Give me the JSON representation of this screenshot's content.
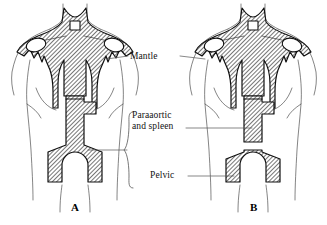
{
  "diagram": {
    "type": "anatomical-line-diagram",
    "ink_color": "#111111",
    "hatch_color": "#111111",
    "background": "#ffffff",
    "labels": {
      "mantle": "Mantle",
      "paraaortic_line1": "Paraaortic",
      "paraaortic_line2": "and spleen",
      "pelvic": "Pelvic"
    },
    "panels": [
      {
        "id": "A",
        "label": "A",
        "fields": [
          "Mantle",
          "Paraaortic and spleen",
          "Pelvic"
        ],
        "note": "Subdiaphragmatic fields joined as a continuous inverted-Y"
      },
      {
        "id": "B",
        "label": "B",
        "fields": [
          "Mantle",
          "Paraaortic and spleen",
          "Pelvic"
        ],
        "note": "Paraaortic/spleen and pelvic fields separated by a gap"
      }
    ],
    "leaders": [
      {
        "from": "mantle",
        "to": "panel-A-mantle"
      },
      {
        "from": "mantle",
        "to": "panel-B-mantle"
      },
      {
        "from": "paraaortic",
        "to": "panel-A-paraaortic-brace"
      },
      {
        "from": "paraaortic",
        "to": "panel-B-paraaortic"
      },
      {
        "from": "pelvic",
        "to": "panel-B-pelvic"
      }
    ]
  }
}
